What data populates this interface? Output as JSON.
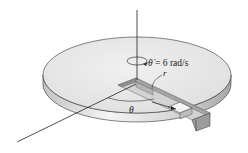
{
  "diagram": {
    "angular_velocity_label": "θ̇ = 6 rad/s",
    "angular_velocity_symbol": "θ̇",
    "angular_velocity_value": "= 6 rad/s",
    "radius_label": "r",
    "angle_label": "θ",
    "colors": {
      "disk_top": "#e9e9e9",
      "disk_edge_light": "#f2f2f2",
      "disk_edge_dark": "#b8b8b8",
      "slot_dark": "#9a9a9a",
      "slot_mid": "#c8c8c8",
      "line": "#222222"
    }
  }
}
